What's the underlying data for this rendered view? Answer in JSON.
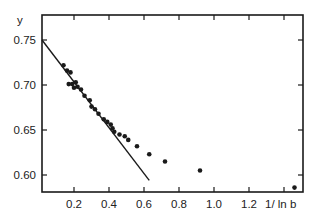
{
  "chart_data": {
    "type": "scatter",
    "title": "",
    "xlabel": "1/ln b",
    "ylabel": "y",
    "xlim": [
      0.0,
      1.5
    ],
    "ylim": [
      0.583,
      0.778
    ],
    "x_ticks": [
      0.2,
      0.4,
      0.6,
      0.8,
      1.0,
      1.2
    ],
    "x_tick_labels": [
      "0.2",
      "0.4",
      "0.6",
      "0.8",
      "1.0",
      "1.2"
    ],
    "y_ticks": [
      0.6,
      0.65,
      0.7,
      0.75
    ],
    "y_tick_labels": [
      "0.60",
      "0.65",
      "0.70",
      "0.75"
    ],
    "grid": false,
    "legend": null,
    "series": [
      {
        "name": "data",
        "kind": "points",
        "x": [
          0.14,
          0.16,
          0.18,
          0.17,
          0.19,
          0.21,
          0.2,
          0.22,
          0.24,
          0.26,
          0.29,
          0.3,
          0.32,
          0.34,
          0.37,
          0.39,
          0.41,
          0.42,
          0.43,
          0.46,
          0.49,
          0.51,
          0.56,
          0.63,
          0.72,
          0.92,
          1.46
        ],
        "y": [
          0.722,
          0.716,
          0.714,
          0.701,
          0.701,
          0.703,
          0.697,
          0.698,
          0.695,
          0.688,
          0.683,
          0.676,
          0.673,
          0.668,
          0.662,
          0.659,
          0.656,
          0.652,
          0.648,
          0.645,
          0.643,
          0.639,
          0.632,
          0.623,
          0.615,
          0.605,
          0.586
        ]
      },
      {
        "name": "linear fit",
        "kind": "line",
        "x": [
          0.0,
          0.63
        ],
        "y": [
          0.75,
          0.594
        ]
      }
    ]
  },
  "labels": {
    "y_axis": "y",
    "x_axis": "1/ ln b"
  }
}
